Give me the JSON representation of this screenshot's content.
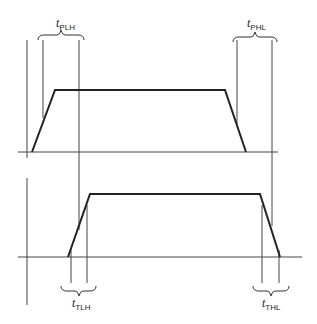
{
  "diagram": {
    "labels": {
      "tplh": {
        "main": "t",
        "sub": "PLH"
      },
      "tphl": {
        "main": "t",
        "sub": "PHL"
      },
      "ttlh": {
        "main": "t",
        "sub": "TLH"
      },
      "tthl": {
        "main": "t",
        "sub": "THL"
      }
    },
    "waveforms": [
      {
        "name": "input",
        "baseline_y": 152,
        "high_y": 90,
        "rise": [
          32,
          55
        ],
        "fall": [
          225,
          246
        ]
      },
      {
        "name": "output",
        "baseline_y": 257,
        "high_y": 194,
        "rise": [
          68,
          90
        ],
        "fall": [
          260,
          280
        ]
      }
    ],
    "colors": {
      "line": "#222222",
      "guide": "#444444",
      "background": "#ffffff"
    }
  }
}
